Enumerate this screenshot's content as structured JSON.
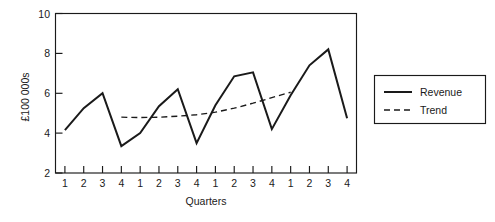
{
  "chart_data": {
    "type": "line",
    "title": "",
    "xlabel": "Quarters",
    "ylabel": "£100 000s",
    "xlim": [
      0.5,
      16.5
    ],
    "ylim": [
      2,
      10
    ],
    "yticks": [
      2,
      4,
      6,
      8,
      10
    ],
    "ytick_labels": [
      "2",
      "4",
      "6",
      "8",
      "10"
    ],
    "grid": false,
    "legend_position": "right-outside",
    "x": [
      1,
      2,
      3,
      4,
      5,
      6,
      7,
      8,
      9,
      10,
      11,
      12,
      13,
      14,
      15,
      16
    ],
    "categories": [
      "1",
      "2",
      "3",
      "4",
      "1",
      "2",
      "3",
      "4",
      "1",
      "2",
      "3",
      "4",
      "1",
      "2",
      "3",
      "4"
    ],
    "series": [
      {
        "name": "Revenue",
        "style": "solid",
        "color": "#1a1a1a",
        "values": [
          4.15,
          5.25,
          6.0,
          3.35,
          4.0,
          5.35,
          6.2,
          3.5,
          5.4,
          6.85,
          7.05,
          4.2,
          5.9,
          7.4,
          8.2,
          4.75
        ]
      },
      {
        "name": "Trend",
        "style": "dashed",
        "color": "#1a1a1a",
        "x": [
          4,
          5,
          6,
          7,
          8,
          9,
          10,
          11,
          12,
          13
        ],
        "values": [
          4.8,
          4.78,
          4.8,
          4.85,
          4.92,
          5.05,
          5.25,
          5.5,
          5.78,
          6.05
        ]
      }
    ]
  },
  "axes": {
    "y_title": "£100 000s",
    "x_title": "Quarters"
  },
  "legend": {
    "entries": [
      {
        "label": "Revenue",
        "style": "solid"
      },
      {
        "label": "Trend",
        "style": "dashed"
      }
    ]
  }
}
